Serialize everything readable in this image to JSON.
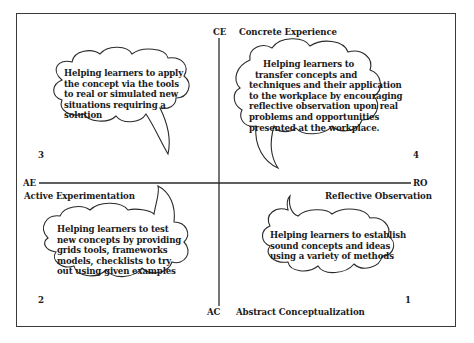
{
  "axes": {
    "top": {
      "abbr": "CE",
      "label": "Concrete Experience"
    },
    "bottom": {
      "abbr": "AC",
      "label": "Abstract Conceptualization"
    },
    "left": {
      "abbr": "AE",
      "label": "Active Experimentation"
    },
    "right": {
      "abbr": "RO",
      "label": "Reflective Observation"
    }
  },
  "quadrants": [
    {
      "number": "3",
      "position": "top-left",
      "lines": [
        "Helping learners to apply",
        "the concept via the tools",
        "to real or simulated new",
        "situations requiring a",
        "solution"
      ]
    },
    {
      "number": "4",
      "position": "top-right",
      "lines": [
        "Helping learners to",
        "transfer concepts and",
        "techniques and their application",
        "to the workplace by encouraging",
        "reflective observation upon real",
        "problems and opportunities",
        "presented at the workplace."
      ]
    },
    {
      "number": "2",
      "position": "bottom-left",
      "lines": [
        "Helping learners to test",
        "new concepts by providing",
        "grids tools, frameworks",
        "models, checklists to try",
        "out using given examples"
      ]
    },
    {
      "number": "1",
      "position": "bottom-right",
      "lines": [
        "Helping learners to establish",
        "sound concepts and ideas",
        "using a variety of methods"
      ]
    }
  ]
}
